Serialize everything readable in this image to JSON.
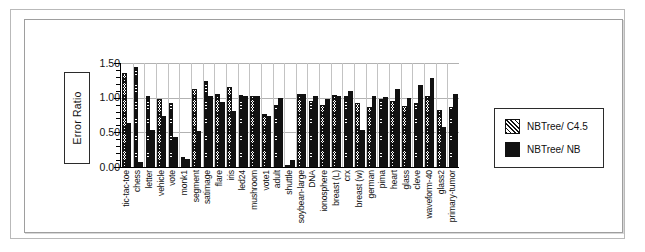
{
  "chart_data": {
    "type": "bar",
    "title": "",
    "xlabel": "",
    "ylabel": "Error Ratio",
    "ylim": [
      0.0,
      1.5
    ],
    "yticks": [
      0.0,
      0.5,
      1.0,
      1.5
    ],
    "ytick_labels": [
      "0.00",
      "0.50",
      "1.00",
      "1.50"
    ],
    "grid": true,
    "legend_position": "right-outside",
    "categories": [
      "tic-tac-toe",
      "chess",
      "letter",
      "vehicle",
      "vote",
      "monk1",
      "segment",
      "satimage",
      "flare",
      "iris",
      "led24",
      "mushroom",
      "vote1",
      "adult",
      "shuttle",
      "soybean-large",
      "DNA",
      "ionosphere",
      "breast (L)",
      "crx",
      "breast (w)",
      "german",
      "pima",
      "heart",
      "glass",
      "cleve",
      "waveform-40",
      "glass2",
      "primary-tumor"
    ],
    "series": [
      {
        "name": "NBTree/ C4.5",
        "values": [
          1.32,
          1.42,
          0.99,
          0.95,
          0.89,
          0.11,
          1.09,
          1.21,
          1.03,
          1.13,
          1.01,
          0.99,
          0.73,
          0.87,
          0.0,
          1.02,
          0.92,
          0.86,
          1.01,
          1.0,
          0.9,
          0.83,
          0.95,
          0.93,
          0.85,
          0.89,
          1.0,
          0.8,
          0.83
        ]
      },
      {
        "name": "NBTree/ NB",
        "values": [
          0.61,
          0.04,
          0.5,
          0.71,
          0.4,
          0.09,
          0.49,
          0.99,
          0.91,
          0.78,
          0.99,
          0.99,
          0.71,
          0.96,
          0.07,
          1.02,
          1.0,
          0.95,
          1.0,
          1.07,
          0.51,
          1.0,
          0.98,
          1.09,
          0.97,
          1.15,
          1.26,
          0.55,
          1.03
        ]
      }
    ]
  },
  "legend": {
    "entries": [
      {
        "label": "NBTree/ C4.5",
        "swatch": "hatched-diagonal",
        "color": "#111111"
      },
      {
        "label": "NBTree/ NB",
        "swatch": "solid-fill",
        "color": "#111111"
      }
    ]
  },
  "colors": {
    "axis": "#000000",
    "gridline": "#b2b2b2",
    "bar_c45": "#111111",
    "bar_nb": "#111111",
    "background": "#ffffff",
    "frame": "#9e9e9e"
  }
}
